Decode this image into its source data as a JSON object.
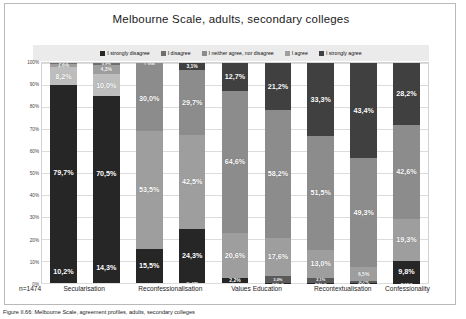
{
  "chart_data": {
    "type": "bar",
    "subtype": "100% stacked column",
    "title": "Melbourne Scale, adults, secondary colleges",
    "xlabel": "",
    "ylabel": "",
    "ylim": [
      0,
      100
    ],
    "ytick_labels": [
      "0%",
      "10%",
      "20%",
      "30%",
      "40%",
      "50%",
      "60%",
      "70%",
      "80%",
      "90%",
      "100%"
    ],
    "grid": true,
    "legend_position": "top",
    "sample_size_label": "n=1474",
    "categories": [
      "Secularisation",
      "Reconfessionalisation",
      "Values Education",
      "Recontextualisation",
      "Confessionality"
    ],
    "legend_entries": [
      "I strongly disagree",
      "I disagree",
      "I neither agree, nor disagree",
      "I agree",
      "I strongly agree"
    ],
    "colors": {
      "strongly_disagree": "#262626",
      "disagree": "#6e6e6e",
      "neither": "#8c8c8c",
      "agree": "#9e9e9e",
      "strongly_agree": "#404040",
      "legend_strip": "#ebebeb",
      "plot_bg": "#ffffff",
      "gridline": "#dcdcdc"
    },
    "bars": [
      {
        "group": "Secularisation",
        "index": 0,
        "segments": [
          {
            "key": "strongly_disagree",
            "label": "10,2%",
            "value": 10.2,
            "color": "#262626",
            "label_size": "normal"
          },
          {
            "key": "disagree",
            "label": "79,7%",
            "value": 79.7,
            "color": "#262626",
            "label_size": "normal"
          },
          {
            "key": "neither",
            "label": "8,2%",
            "value": 8.2,
            "color": "#bdbdbd",
            "label_size": "normal"
          },
          {
            "key": "agree",
            "label": "1,6%",
            "value": 1.6,
            "color": "#9e9e9e",
            "label_size": "tiny"
          },
          {
            "key": "strongly_agree",
            "label": "0,3%",
            "value": 0.3,
            "color": "#6e6e6e",
            "label_size": "mini"
          }
        ]
      },
      {
        "group": "Secularisation",
        "index": 1,
        "segments": [
          {
            "key": "strongly_disagree",
            "label": "14,3%",
            "value": 14.3,
            "color": "#262626",
            "label_size": "normal"
          },
          {
            "key": "disagree",
            "label": "70,5%",
            "value": 70.5,
            "color": "#262626",
            "label_size": "normal"
          },
          {
            "key": "neither",
            "label": "10,0%",
            "value": 10.0,
            "color": "#bdbdbd",
            "label_size": "normal"
          },
          {
            "key": "agree",
            "label": "4,3%",
            "value": 4.3,
            "color": "#9e9e9e",
            "label_size": "tiny"
          },
          {
            "key": "strongly_agree",
            "label": "0,9%",
            "value": 0.9,
            "color": "#6e6e6e",
            "label_size": "mini"
          }
        ]
      },
      {
        "group": "Reconfessionalisation",
        "index": 2,
        "segments": [
          {
            "key": "strongly_disagree",
            "label": "15,5%",
            "value": 15.5,
            "color": "#262626",
            "label_size": "normal"
          },
          {
            "key": "disagree",
            "label": "53,5%",
            "value": 53.5,
            "color": "#9e9e9e",
            "label_size": "normal"
          },
          {
            "key": "neither",
            "label": "30,0%",
            "value": 30.0,
            "color": "#8c8c8c",
            "label_size": "normal"
          },
          {
            "key": "agree",
            "label": "1,0%",
            "value": 1.0,
            "color": "#8c8c8c",
            "label_size": "tiny"
          },
          {
            "key": "strongly_agree",
            "label": "",
            "value": 0.0,
            "color": "#6e6e6e",
            "label_size": "mini"
          }
        ]
      },
      {
        "group": "Reconfessionalisation",
        "index": 3,
        "segments": [
          {
            "key": "strongly_disagree",
            "label": "0,5%",
            "value": 0.5,
            "color": "#262626",
            "label_size": "tiny"
          },
          {
            "key": "disagree",
            "label": "24,3%",
            "value": 24.3,
            "color": "#262626",
            "label_size": "normal"
          },
          {
            "key": "neither",
            "label": "42,5%",
            "value": 42.5,
            "color": "#9e9e9e",
            "label_size": "normal"
          },
          {
            "key": "agree",
            "label": "29,7%",
            "value": 29.7,
            "color": "#8c8c8c",
            "label_size": "normal"
          },
          {
            "key": "strongly_agree",
            "label": "3,1%",
            "value": 3.1,
            "color": "#404040",
            "label_size": "tiny"
          }
        ]
      },
      {
        "group": "Values Education",
        "index": 4,
        "segments": [
          {
            "key": "strongly_disagree",
            "label": "2,2%",
            "value": 2.2,
            "color": "#262626",
            "label_size": "tiny"
          },
          {
            "key": "disagree",
            "label": "20,6%",
            "value": 20.6,
            "color": "#9e9e9e",
            "label_size": "normal"
          },
          {
            "key": "neither",
            "label": "64,6%",
            "value": 64.6,
            "color": "#8c8c8c",
            "label_size": "normal"
          },
          {
            "key": "agree",
            "label": "12,7%",
            "value": 12.7,
            "color": "#404040",
            "label_size": "normal"
          },
          {
            "key": "strongly_agree",
            "label": "",
            "value": 0.0,
            "color": "#6e6e6e",
            "label_size": "mini"
          }
        ]
      },
      {
        "group": "Values Education",
        "index": 5,
        "segments": [
          {
            "key": "strongly_disagree",
            "label": "0,07%",
            "value": 0.07,
            "color": "#262626",
            "label_size": "mini"
          },
          {
            "key": "disagree",
            "label": "3,0%",
            "value": 3.0,
            "color": "#5a5a5a",
            "label_size": "mini"
          },
          {
            "key": "neither",
            "label": "17,6%",
            "value": 17.6,
            "color": "#9e9e9e",
            "label_size": "normal"
          },
          {
            "key": "agree",
            "label": "58,2%",
            "value": 58.2,
            "color": "#8c8c8c",
            "label_size": "normal"
          },
          {
            "key": "strongly_agree",
            "label": "21,2%",
            "value": 21.2,
            "color": "#404040",
            "label_size": "normal"
          }
        ]
      },
      {
        "group": "Recontextualisation",
        "index": 6,
        "segments": [
          {
            "key": "strongly_disagree",
            "label": "0,07%",
            "value": 0.07,
            "color": "#262626",
            "label_size": "mini"
          },
          {
            "key": "disagree",
            "label": "2,1%",
            "value": 2.1,
            "color": "#5a5a5a",
            "label_size": "mini"
          },
          {
            "key": "neither",
            "label": "13,0%",
            "value": 13.0,
            "color": "#9e9e9e",
            "label_size": "normal"
          },
          {
            "key": "agree",
            "label": "51,5%",
            "value": 51.5,
            "color": "#8c8c8c",
            "label_size": "normal"
          },
          {
            "key": "strongly_agree",
            "label": "33,3%",
            "value": 33.3,
            "color": "#404040",
            "label_size": "normal"
          }
        ]
      },
      {
        "group": "Recontextualisation",
        "index": 7,
        "segments": [
          {
            "key": "strongly_disagree",
            "label": "0,07%",
            "value": 0.07,
            "color": "#262626",
            "label_size": "mini"
          },
          {
            "key": "disagree",
            "label": "0,7%",
            "value": 0.7,
            "color": "#5a5a5a",
            "label_size": "mini"
          },
          {
            "key": "neither",
            "label": "6,5%",
            "value": 6.5,
            "color": "#9e9e9e",
            "label_size": "tiny"
          },
          {
            "key": "agree",
            "label": "49,3%",
            "value": 49.3,
            "color": "#8c8c8c",
            "label_size": "normal"
          },
          {
            "key": "strongly_agree",
            "label": "43,4%",
            "value": 43.4,
            "color": "#404040",
            "label_size": "normal"
          }
        ]
      },
      {
        "group": "Confessionality",
        "index": 8,
        "segments": [
          {
            "key": "strongly_disagree",
            "label": "0,15%",
            "value": 0.15,
            "color": "#262626",
            "label_size": "mini"
          },
          {
            "key": "disagree",
            "label": "9,8%",
            "value": 9.8,
            "color": "#262626",
            "label_size": "normal"
          },
          {
            "key": "neither",
            "label": "19,3%",
            "value": 19.3,
            "color": "#9e9e9e",
            "label_size": "normal"
          },
          {
            "key": "agree",
            "label": "42,6%",
            "value": 42.6,
            "color": "#8c8c8c",
            "label_size": "normal"
          },
          {
            "key": "strongly_agree",
            "label": "28,2%",
            "value": 28.2,
            "color": "#404040",
            "label_size": "normal"
          }
        ]
      }
    ]
  },
  "caption": "Figure II.66: Melbourne Scale, agreement profiles, adults, secondary colleges"
}
